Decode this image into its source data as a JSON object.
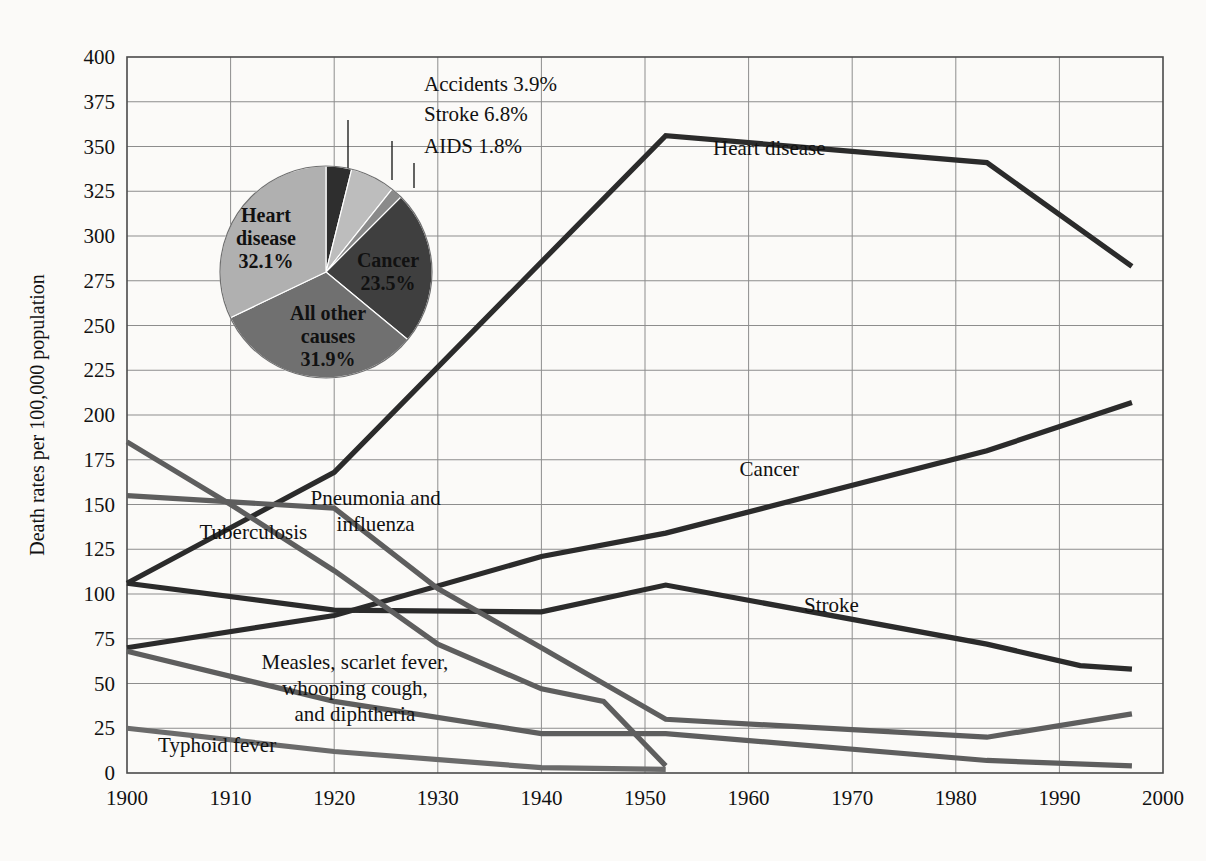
{
  "chart_data": {
    "type": "line",
    "title": "",
    "xlabel": "",
    "ylabel": "Death rates per 100,000 population",
    "xlim": [
      1900,
      2000
    ],
    "ylim": [
      0,
      400
    ],
    "grid": true,
    "legend": "inline-labels",
    "xticks": [
      "1900",
      "1910",
      "1920",
      "1930",
      "1940",
      "1950",
      "1960",
      "1970",
      "1980",
      "1990",
      "2000"
    ],
    "yticks": [
      "400",
      "375",
      "350",
      "325",
      "300",
      "275",
      "250",
      "225",
      "200",
      "175",
      "150",
      "125",
      "100",
      "75",
      "50",
      "25",
      "0"
    ],
    "series": [
      {
        "name": "Heart disease",
        "color": "#2b2b2b",
        "label_x": 1962,
        "label_y": 345,
        "points": [
          [
            1900,
            106
          ],
          [
            1920,
            168
          ],
          [
            1952,
            356
          ],
          [
            1983,
            341
          ],
          [
            1997,
            283
          ]
        ]
      },
      {
        "name": "Cancer",
        "color": "#2b2b2b",
        "label_x": 1962,
        "label_y": 166,
        "points": [
          [
            1900,
            70
          ],
          [
            1920,
            88
          ],
          [
            1940,
            121
          ],
          [
            1952,
            134
          ],
          [
            1983,
            180
          ],
          [
            1997,
            207
          ]
        ]
      },
      {
        "name": "Stroke",
        "color": "#2b2b2b",
        "label_x": 1968,
        "label_y": 90,
        "points": [
          [
            1900,
            106
          ],
          [
            1920,
            91
          ],
          [
            1940,
            90
          ],
          [
            1952,
            105
          ],
          [
            1983,
            72
          ],
          [
            1992,
            60
          ],
          [
            1997,
            58
          ]
        ]
      },
      {
        "name": "Pneumonia and influenza",
        "color": "#5e5e5e",
        "label_x": 1924,
        "label_y": 150,
        "label_lines": [
          "Pneumonia and",
          "influenza"
        ],
        "points": [
          [
            1900,
            155
          ],
          [
            1920,
            148
          ],
          [
            1930,
            103
          ],
          [
            1940,
            70
          ],
          [
            1952,
            30
          ],
          [
            1983,
            20
          ],
          [
            1997,
            33
          ]
        ]
      },
      {
        "name": "Tuberculosis",
        "color": "#5e5e5e",
        "label_x": 1907,
        "label_y": 131,
        "points": [
          [
            1900,
            185
          ],
          [
            1910,
            150
          ],
          [
            1920,
            113
          ],
          [
            1930,
            72
          ],
          [
            1940,
            47
          ],
          [
            1946,
            40
          ],
          [
            1952,
            4
          ]
        ]
      },
      {
        "name": "Measles, scarlet fever, whooping cough, and diphtheria",
        "color": "#5e5e5e",
        "label_x": 1922,
        "label_y": 58,
        "label_lines": [
          "Measles, scarlet fever,",
          "whooping cough,",
          "and diphtheria"
        ],
        "points": [
          [
            1900,
            68
          ],
          [
            1920,
            40
          ],
          [
            1940,
            22
          ],
          [
            1952,
            22
          ],
          [
            1983,
            7
          ],
          [
            1997,
            4
          ]
        ]
      },
      {
        "name": "Typhoid fever",
        "color": "#6b6b6b",
        "label_x": 1903,
        "label_y": 12,
        "points": [
          [
            1900,
            25
          ],
          [
            1920,
            12
          ],
          [
            1940,
            3
          ],
          [
            1952,
            2
          ]
        ]
      }
    ]
  },
  "pie": {
    "title": "",
    "center_x": 326,
    "center_y": 272,
    "radius": 106,
    "slices": [
      {
        "name": "Accidents",
        "value": 3.9,
        "label": "Accidents 3.9%",
        "color": "#2e2e2e",
        "label_pos": "outside"
      },
      {
        "name": "Stroke",
        "value": 6.8,
        "label": "Stroke 6.8%",
        "color": "#bdbdbd",
        "label_pos": "outside"
      },
      {
        "name": "AIDS",
        "value": 1.8,
        "label": "AIDS 1.8%",
        "color": "#8a8a8a",
        "label_pos": "outside"
      },
      {
        "name": "Cancer",
        "value": 23.5,
        "label_lines": [
          "Cancer",
          "23.5%"
        ],
        "color": "#3f3f3f",
        "label_pos": "inside"
      },
      {
        "name": "All other causes",
        "value": 31.9,
        "label_lines": [
          "All other",
          "causes",
          "31.9%"
        ],
        "color": "#707070",
        "label_pos": "inside"
      },
      {
        "name": "Heart disease",
        "value": 32.1,
        "label_lines": [
          "Heart",
          "disease",
          "32.1%"
        ],
        "color": "#b0b0b0",
        "label_pos": "inside"
      }
    ],
    "callouts": [
      {
        "name": "Accidents 3.9%",
        "text": "Accidents 3.9%",
        "text_x": 424,
        "text_y": 91,
        "line_x": 348,
        "line_y1": 120,
        "line_y2": 168
      },
      {
        "name": "Stroke 6.8%",
        "text": "Stroke 6.8%",
        "text_x": 424,
        "text_y": 121,
        "line_x": 392,
        "line_y1": 141,
        "line_y2": 180
      },
      {
        "name": "AIDS 1.8%",
        "text": "AIDS 1.8%",
        "text_x": 424,
        "text_y": 153,
        "line_x": 414,
        "line_y1": 163,
        "line_y2": 188
      }
    ]
  },
  "colors": {
    "background": "#fbfaf8",
    "grid": "#8d8d8d",
    "frame": "#4a4a4a",
    "dark_series": "#2b2b2b",
    "gray_series": "#5e5e5e"
  }
}
